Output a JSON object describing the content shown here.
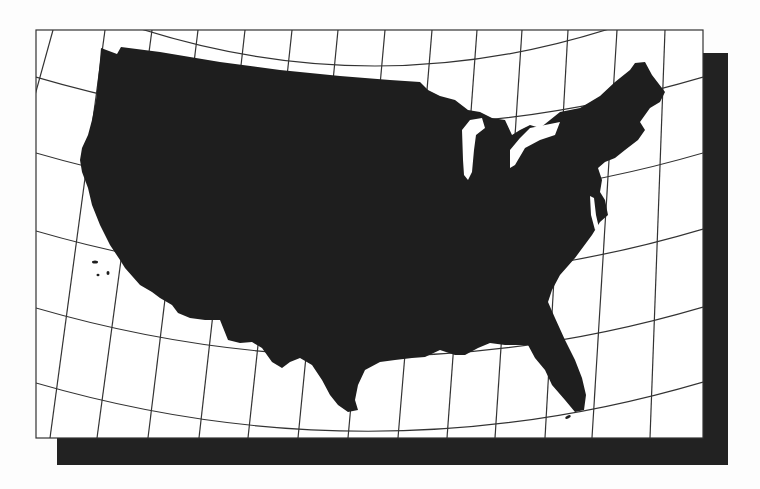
{
  "map": {
    "title": "Conterminous United States — conic projection with graticule",
    "subject": "United States (lower 48) silhouette",
    "projection": "conic (curved parallels, converging meridians)",
    "labels": [],
    "colors": {
      "background": "#fdfdfd",
      "frame_fill": "#ffffff",
      "land": "#1e1e1e",
      "graticule": "#333333",
      "shadow": "#222222"
    },
    "frame": {
      "x": 36,
      "y": 30,
      "width": 667,
      "height": 408
    },
    "shadow": {
      "offset_x": 25,
      "offset_y": 27
    },
    "graticule": {
      "meridians_count": 14,
      "parallels_count": 6
    }
  }
}
